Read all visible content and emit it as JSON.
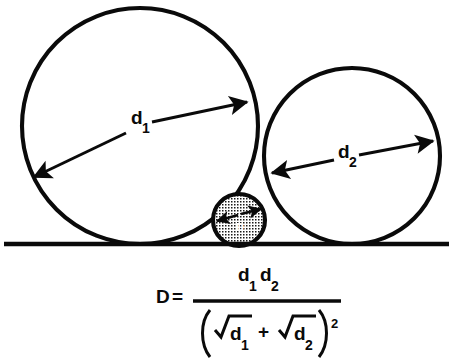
{
  "figure": {
    "background_color": "#ffffff",
    "ink_color": "#0a0a0a",
    "ground_line_label": "baseline"
  },
  "labels": {
    "d1_base": "d",
    "d1_sub": "1",
    "d2_base": "d",
    "d2_sub": "2",
    "small_circle_label": "D"
  },
  "formula": {
    "lhs": "D",
    "equals": "=",
    "numerator": {
      "first_base": "d",
      "first_sub": "1",
      "second_base": "d",
      "second_sub": "2"
    },
    "denominator": {
      "left_paren": "(",
      "first_base": "d",
      "first_sub": "1",
      "plus": "+",
      "second_base": "d",
      "second_sub": "2",
      "right_paren": ")",
      "exponent": "2"
    },
    "plain_text": "D = d1*d2 / (sqrt(d1) + sqrt(d2))^2"
  },
  "shapes": {
    "circle_large": {
      "cx": 140,
      "cy": 126,
      "r": 118
    },
    "circle_medium": {
      "cx": 352,
      "cy": 156,
      "r": 88
    },
    "circle_small": {
      "cx": 239,
      "cy": 220,
      "r": 26
    },
    "ground_line": {
      "x1": 4,
      "y1": 244,
      "x2": 449,
      "y2": 244
    }
  }
}
